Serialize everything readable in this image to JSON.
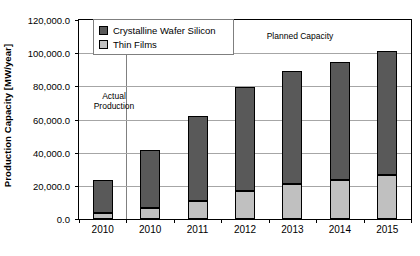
{
  "chart_data": {
    "type": "bar",
    "stacked": true,
    "title": "",
    "xlabel": "",
    "ylabel": "Production Capacity [MW/year]",
    "ylim": [
      0,
      120000
    ],
    "ytick_labels": [
      "0.0",
      "20,000.0",
      "40,000.0",
      "60,000.0",
      "80,000.0",
      "100,000.0",
      "120,000.0"
    ],
    "ytick_values": [
      0,
      20000,
      40000,
      60000,
      80000,
      100000,
      120000
    ],
    "grid": true,
    "legend_position": "top-left-inside",
    "categories": [
      "2010",
      "2010",
      "2011",
      "2012",
      "2013",
      "2014",
      "2015"
    ],
    "series": [
      {
        "name": "Thin Films",
        "color": "#c0c0c0",
        "values": [
          3500,
          6800,
          11000,
          17000,
          21000,
          23500,
          26500
        ]
      },
      {
        "name": "Crystalline Wafer Silicon",
        "color": "#595959",
        "values": [
          20000,
          34700,
          51000,
          62500,
          68500,
          71000,
          75000
        ]
      }
    ],
    "totals": [
      23500,
      41500,
      62000,
      79500,
      89500,
      94500,
      101500
    ],
    "annotations": [
      {
        "text": "Actual\nProduction",
        "name": "actual-production-annotation"
      },
      {
        "text": "Planned Capacity",
        "name": "planned-capacity-annotation"
      }
    ]
  },
  "legend": {
    "items": [
      {
        "label": "Crystalline Wafer Silicon",
        "color": "#595959"
      },
      {
        "label": "Thin Films",
        "color": "#c0c0c0"
      }
    ]
  },
  "axes": {
    "y_title": "Production Capacity [MW/year]"
  }
}
